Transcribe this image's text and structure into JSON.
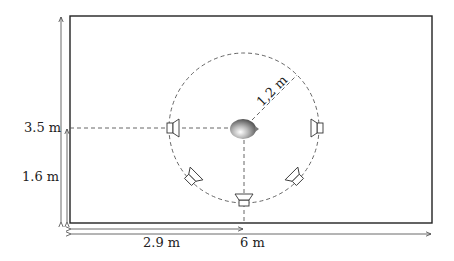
{
  "diagram": {
    "room": {
      "width_label": "6 m",
      "height_label": "3.5 m"
    },
    "listener": {
      "x_label": "2.9 m",
      "y_label": "1.6 m"
    },
    "circle": {
      "radius_label": "1,2 m"
    },
    "speakers": [
      {
        "id": "left",
        "facing": "right"
      },
      {
        "id": "right",
        "facing": "left"
      },
      {
        "id": "bottom-left",
        "facing": "up-right"
      },
      {
        "id": "bottom",
        "facing": "up"
      },
      {
        "id": "bottom-right",
        "facing": "up-left"
      }
    ],
    "colors": {
      "wall": "#222222",
      "dash": "#555555",
      "dim": "#444444"
    }
  }
}
